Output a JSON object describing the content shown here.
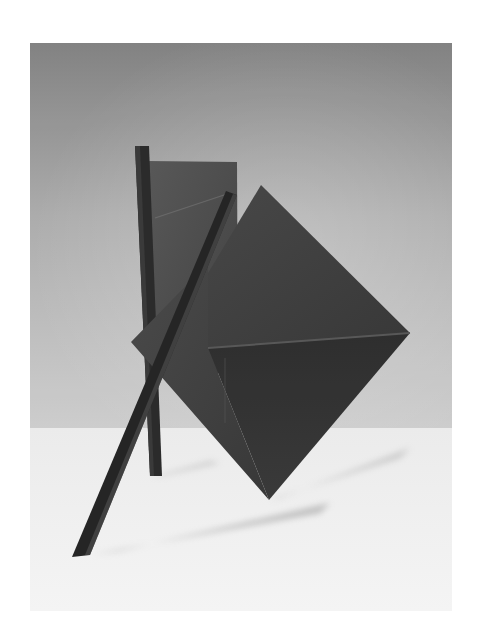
{
  "photo": {
    "subject": "abstract-steel-sculpture",
    "alt": "Black and white photograph of a geometric metal sculpture: a tilted diamond (octahedral) form, a rectangular plate, a vertical post and a diagonal leaning bar, standing on a white floor against a grey gradient wall",
    "colors": {
      "page_background": "#ffffff",
      "wall_top": "#8a8a8a",
      "wall_mid": "#b4b4b4",
      "wall_bottom": "#cfcfcf",
      "floor": "#f4f4f4",
      "metal_dark": "#2e2e2e",
      "metal_mid": "#4a4a4a",
      "metal_light": "#5e5e5e",
      "shadow": "#d6d6d6"
    }
  }
}
